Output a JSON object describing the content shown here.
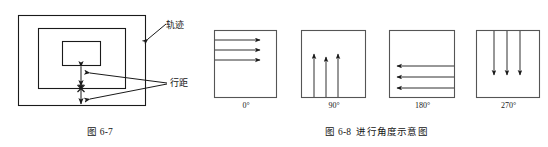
{
  "figures": [
    {
      "id": "fig-6-7",
      "caption_number": "图 6-7",
      "caption_title": "",
      "callouts": [
        {
          "name": "trajectory",
          "text": "轨迹"
        },
        {
          "name": "line-spacing",
          "text": "行距"
        }
      ],
      "shapes": {
        "outer_rect": "轨迹 outer boundary",
        "middle_rect": "轨迹 middle boundary",
        "inner_rect": "轨迹 inner boundary",
        "center_mark": "×"
      }
    },
    {
      "id": "fig-6-8",
      "caption_number": "图 6-8",
      "caption_title": "进行角度示意图",
      "panels": [
        {
          "name": "angle-0",
          "label": "0°",
          "direction": "right"
        },
        {
          "name": "angle-90",
          "label": "90°",
          "direction": "up"
        },
        {
          "name": "angle-180",
          "label": "180°",
          "direction": "left"
        },
        {
          "name": "angle-270",
          "label": "270°",
          "direction": "down"
        }
      ]
    }
  ],
  "colors": {
    "line": "#1a1a1a",
    "background": "#ffffff",
    "text": "#141414"
  }
}
